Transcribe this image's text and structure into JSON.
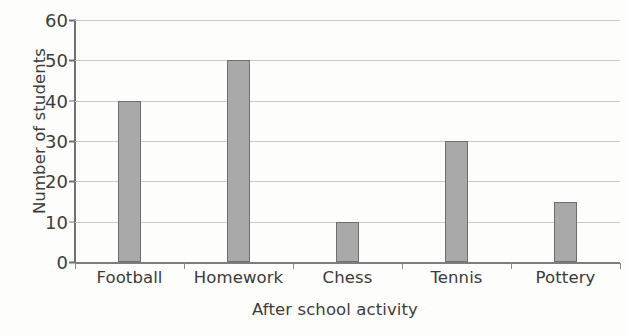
{
  "chart_data": {
    "type": "bar",
    "title": "",
    "xlabel": "After school activity",
    "ylabel": "Number of students",
    "categories": [
      "Football",
      "Homework",
      "Chess",
      "Tennis",
      "Pottery"
    ],
    "values": [
      40,
      50,
      10,
      30,
      15
    ],
    "ylim": [
      0,
      60
    ],
    "ytick_labels": [
      "0",
      "10",
      "20",
      "30",
      "40",
      "50",
      "60"
    ],
    "ytick_values": [
      0,
      10,
      20,
      30,
      40,
      50,
      60
    ],
    "ystep": 10,
    "grid": true,
    "legend": false,
    "colors": {
      "bar_fill": "#a9a9a9",
      "bar_stroke": "#6e6e6e",
      "gridline": "#c9c9c9",
      "axis": "#6f6f6f",
      "text": "#3a3a3a",
      "background": "#fdfdfc"
    }
  }
}
